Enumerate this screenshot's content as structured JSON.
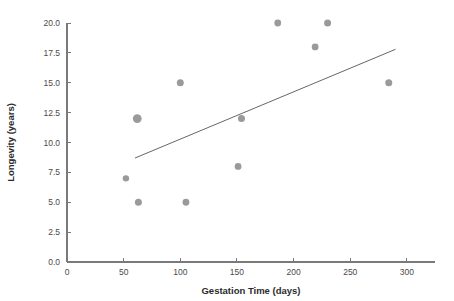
{
  "chart_data": {
    "type": "scatter",
    "title": "",
    "xlabel": "Gestation Time (days)",
    "ylabel": "Longevity (years)",
    "xlim": [
      0,
      315
    ],
    "ylim": [
      0,
      21
    ],
    "grid": false,
    "legend": "none",
    "x_ticks": [
      0,
      50,
      100,
      150,
      200,
      250,
      300
    ],
    "x_tick_labels": [
      "0",
      "50",
      "100",
      "150",
      "200",
      "250",
      "300"
    ],
    "y_ticks": [
      0.0,
      2.5,
      5.0,
      7.5,
      10.0,
      12.5,
      15.0,
      17.5,
      20.0
    ],
    "y_tick_labels": [
      "0.0",
      "2.5",
      "5.0",
      "7.5",
      "10.0",
      "12.5",
      "15.0",
      "17.5",
      "20.0"
    ],
    "points": [
      {
        "x": 52,
        "y": 7,
        "size": 3.2
      },
      {
        "x": 62,
        "y": 12,
        "size": 4.4
      },
      {
        "x": 63,
        "y": 5,
        "size": 3.5
      },
      {
        "x": 100,
        "y": 15,
        "size": 3.5
      },
      {
        "x": 105,
        "y": 5,
        "size": 3.4
      },
      {
        "x": 151,
        "y": 8,
        "size": 3.4
      },
      {
        "x": 154,
        "y": 12,
        "size": 3.5
      },
      {
        "x": 186,
        "y": 20,
        "size": 3.4
      },
      {
        "x": 219,
        "y": 18,
        "size": 3.4
      },
      {
        "x": 230,
        "y": 20,
        "size": 3.5
      },
      {
        "x": 284,
        "y": 15,
        "size": 3.5
      }
    ],
    "trend_line": {
      "x1": 60,
      "y1": 8.7,
      "x2": 290,
      "y2": 17.8
    },
    "marker_color": "#9a9a9a",
    "line_color": "#555555",
    "axis_color": "#7a7a7a",
    "background_color": "#ffffff"
  }
}
